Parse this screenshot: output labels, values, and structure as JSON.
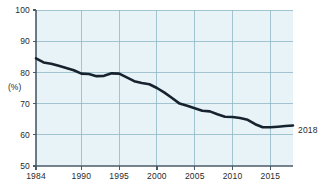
{
  "chart_data": {
    "type": "line",
    "title": "",
    "subtitle": "",
    "xlabel": "",
    "ylabel": "(%)",
    "ylim": [
      50,
      100
    ],
    "xlim": [
      1984,
      2018
    ],
    "grid": true,
    "legend_position": "none",
    "y_ticks": [
      50,
      60,
      70,
      80,
      90,
      100
    ],
    "y_tick_labels": [
      "50",
      "60",
      "70",
      "80",
      "90",
      "100"
    ],
    "x_ticks": [
      1984,
      1990,
      1995,
      2000,
      2005,
      2010,
      2015
    ],
    "x_tick_labels": [
      "1984",
      "1990",
      "1995",
      "2000",
      "2005",
      "2010",
      "2015"
    ],
    "annotations": [
      {
        "text": "2018",
        "x": 2018,
        "y": 63,
        "position": "right-of-plot"
      }
    ],
    "series": [
      {
        "name": "series-1",
        "color": "#16222e",
        "x": [
          1984,
          1985,
          1986,
          1987,
          1988,
          1989,
          1990,
          1991,
          1992,
          1993,
          1994,
          1995,
          1996,
          1997,
          1998,
          1999,
          2000,
          2001,
          2002,
          2003,
          2004,
          2005,
          2006,
          2007,
          2008,
          2009,
          2010,
          2011,
          2012,
          2013,
          2014,
          2015,
          2016,
          2017,
          2018
        ],
        "values": [
          84.5,
          83.2,
          82.8,
          82.1,
          81.4,
          80.7,
          79.6,
          79.5,
          78.8,
          78.9,
          79.7,
          79.6,
          78.4,
          77.2,
          76.6,
          76.2,
          75.0,
          73.5,
          71.8,
          70.0,
          69.3,
          68.5,
          67.7,
          67.5,
          66.6,
          65.8,
          65.7,
          65.4,
          64.8,
          63.4,
          62.4,
          62.4,
          62.6,
          62.8,
          63.0
        ]
      }
    ]
  },
  "axis": {
    "y_unit": "(%)"
  },
  "colors": {
    "plot_background": "#e8f3f7",
    "grid": "#8fb8c6",
    "axis": "#4a5a66",
    "line": "#16222e",
    "text": "#2a2a2a"
  }
}
